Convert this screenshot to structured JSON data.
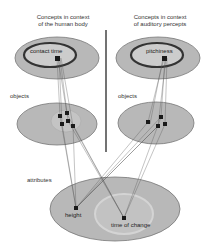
{
  "diagram": {
    "left_header": [
      "Concepts in context",
      "of the human body"
    ],
    "right_header": [
      "Concepts in context",
      "of auditory percepts"
    ],
    "left_concept": "contact time",
    "right_concept": "pitchiness",
    "left_objects_label": "objects",
    "right_objects_label": "objects",
    "attributes_label": "attributes",
    "attribute_1": "height",
    "attribute_2": "time of change",
    "colors": {
      "ellipse_fill": "#b8b8b8",
      "ellipse_stroke": "#777777",
      "inner_fill": "#cccccc",
      "ring": "#333333",
      "node": "#1a1a1a",
      "divider": "#444444"
    }
  }
}
